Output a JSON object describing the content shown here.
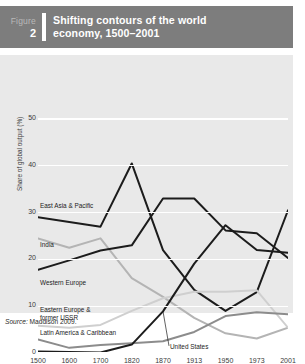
{
  "header": {
    "figure_word": "Figure",
    "figure_number": "2",
    "title_line1": "Shifting contours of the world",
    "title_line2": "economy, 1500–2001",
    "bar_color": "#7d7d7d"
  },
  "source": {
    "prefix": "Source:",
    "text": "Maddison 2009."
  },
  "chart_data": {
    "type": "line",
    "title": "Shifting contours of the world economy, 1500–2001",
    "xlabel": "",
    "ylabel": "Share of global output (%)",
    "categories": [
      "1500",
      "1600",
      "1700",
      "1820",
      "1870",
      "1913",
      "1950",
      "1973",
      "2001"
    ],
    "yticks": [
      0,
      10,
      20,
      30,
      40,
      50
    ],
    "ylim": [
      0,
      50
    ],
    "grid": true,
    "legend": "inline-labels",
    "plot_bg": "#e9e9e9",
    "series": [
      {
        "name": "East Asia & Pacific",
        "color": "#1c1c1c",
        "width": 2.0,
        "values": [
          29.0,
          28.0,
          27.0,
          40.5,
          22.0,
          13.5,
          9.0,
          13.0,
          30.5
        ],
        "label_x": "1500",
        "label_y": 31.5
      },
      {
        "name": "India",
        "color": "#b4b4b4",
        "width": 2.0,
        "values": [
          24.5,
          22.5,
          24.5,
          16.0,
          12.0,
          7.5,
          4.2,
          3.1,
          5.4
        ],
        "label_x": "1500",
        "label_y": 23.0
      },
      {
        "name": "Western Europe",
        "color": "#1c1c1c",
        "width": 2.0,
        "values": [
          17.8,
          19.8,
          21.9,
          23.0,
          33.0,
          33.0,
          26.2,
          25.6,
          20.3
        ],
        "label_x": "1500",
        "label_y": 15.0
      },
      {
        "name": "Eastern Europe & former USSR",
        "color": "#cfcfcf",
        "width": 2.0,
        "values": [
          5.8,
          5.4,
          6.0,
          9.0,
          11.7,
          13.1,
          13.1,
          13.4,
          5.4
        ],
        "label_x": "1500",
        "label_y": 9.2
      },
      {
        "name": "Latin America & Caribbean",
        "color": "#8c8c8c",
        "width": 2.0,
        "values": [
          2.9,
          1.1,
          1.7,
          2.1,
          2.5,
          4.5,
          7.9,
          8.7,
          8.3
        ],
        "label_x": "1500",
        "label_y": 4.3
      },
      {
        "name": "United States",
        "color": "#1c1c1c",
        "width": 2.0,
        "values": [
          0.3,
          0.2,
          0.1,
          1.8,
          8.9,
          19.1,
          27.3,
          22.0,
          21.4
        ],
        "label_x": "1870",
        "label_y": 1.3
      }
    ]
  }
}
